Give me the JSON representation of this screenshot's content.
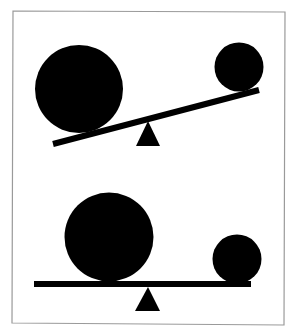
{
  "figure": {
    "colors": {
      "ink": "#000000",
      "frame": "#9a9a9a",
      "background": "#ffffff"
    },
    "scenes": [
      {
        "id": "top",
        "state": "tilted",
        "tilt_direction": "left-side-down",
        "objects": [
          "large-ball",
          "small-ball",
          "board",
          "fulcrum"
        ]
      },
      {
        "id": "bottom",
        "state": "balanced",
        "tilt_direction": "level",
        "objects": [
          "large-ball",
          "small-ball",
          "board",
          "fulcrum"
        ]
      }
    ]
  }
}
